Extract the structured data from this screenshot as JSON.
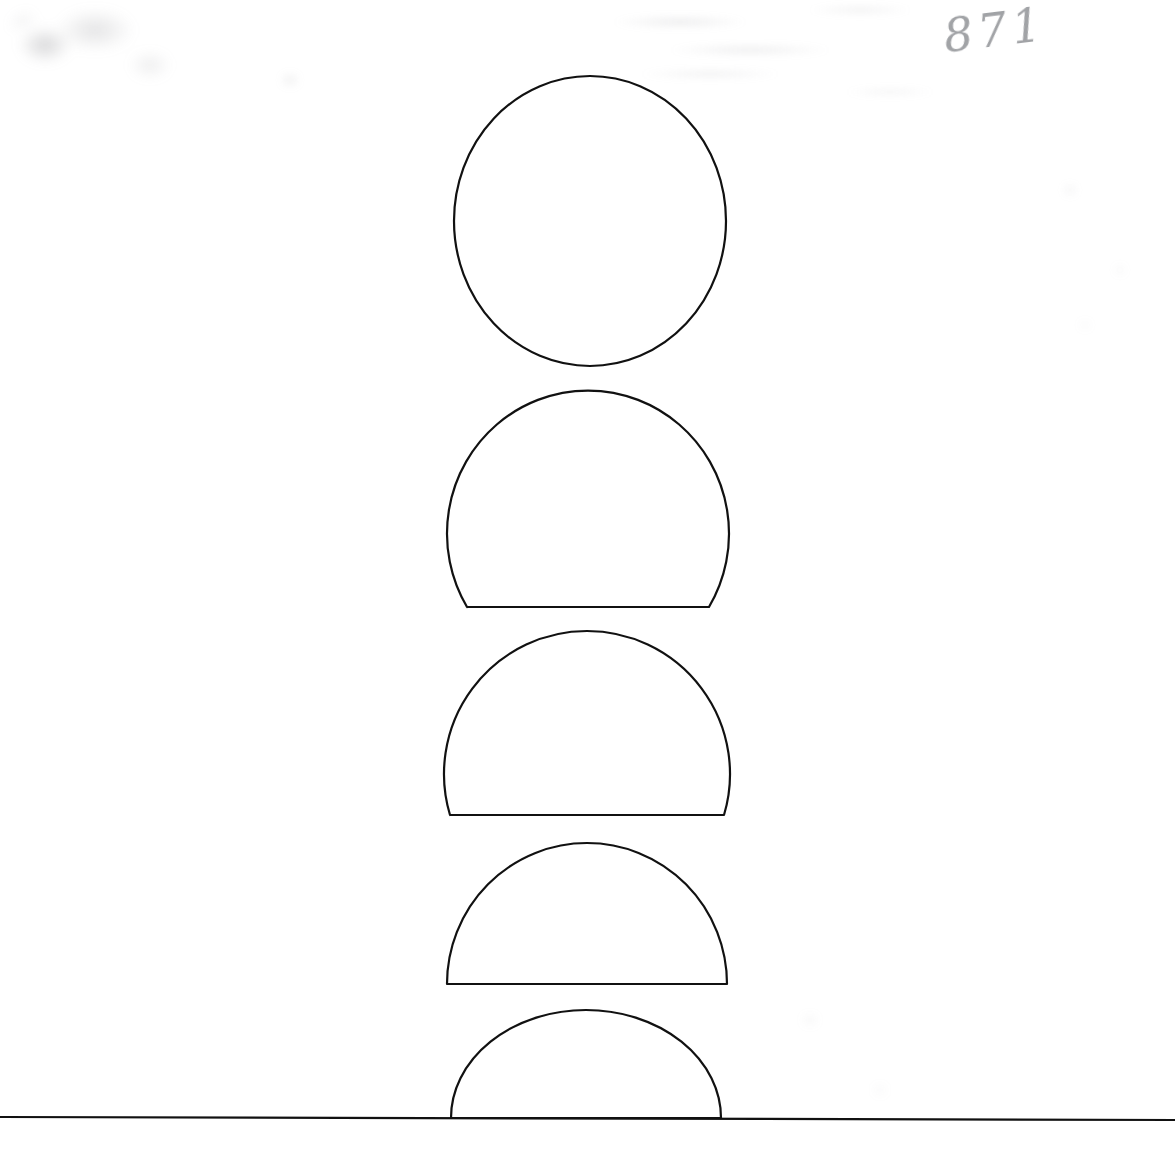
{
  "page": {
    "width": 1175,
    "height": 1159,
    "background_color": "#ffffff",
    "ink_color": "#111111",
    "medium": "scanned hand-drawn ink diagram on paper"
  },
  "annotations": {
    "catalog_number": "871",
    "catalog_number_color": "#8d8f93",
    "catalog_number_position": "top-right"
  },
  "artifacts": [
    {
      "name": "smudge-topleft",
      "label": "gray scan smudge"
    },
    {
      "name": "ghost-text-top",
      "label": "faint bleed-through text"
    },
    {
      "name": "speck-right",
      "label": "paper specks"
    },
    {
      "name": "speck-midleft",
      "label": "paper speck"
    },
    {
      "name": "speck-lower",
      "label": "paper specks"
    }
  ],
  "chart_data": {
    "type": "diagram",
    "title": "871",
    "subtitle": "Sequence of circular segments cut by a chord, descending to a ground line",
    "xlabel": "",
    "ylabel": "",
    "grid": false,
    "legend": false,
    "baseline": {
      "name": "ground-line",
      "x1": 0,
      "y1": 1117,
      "x2": 1175,
      "y2": 1120,
      "stroke_width": 2.2
    },
    "shapes": [
      {
        "index": 1,
        "name": "full-circle",
        "kind": "circle",
        "center_x": 590,
        "center_y": 221,
        "radius_x": 136,
        "radius_y": 145,
        "chord_y": null,
        "top_y": 76,
        "bottom_y": 365,
        "left_x": 454,
        "right_x": 726,
        "width": 272,
        "height": 289,
        "fraction_visible": 1.0
      },
      {
        "index": 2,
        "name": "segment-large",
        "kind": "circular-segment",
        "center_x": 589,
        "center_y": 534,
        "radius_x": 141,
        "radius_y": 143,
        "chord_y": 607,
        "top_y": 392,
        "bottom_y": 607,
        "left_x": 448,
        "right_x": 730,
        "chord_left_x": 467,
        "chord_right_x": 709,
        "width": 282,
        "height": 215,
        "fraction_visible": 0.75
      },
      {
        "index": 3,
        "name": "segment-medium",
        "kind": "circular-segment",
        "center_x": 587,
        "center_y": 775,
        "radius_x": 143,
        "radius_y": 143,
        "chord_y": 815,
        "top_y": 632,
        "bottom_y": 815,
        "left_x": 444,
        "right_x": 730,
        "chord_left_x": 450,
        "chord_right_x": 724,
        "width": 286,
        "height": 183,
        "fraction_visible": 0.64
      },
      {
        "index": 4,
        "name": "semicircle",
        "kind": "semicircle",
        "center_x": 587,
        "center_y": 984,
        "radius_x": 140,
        "radius_y": 141,
        "chord_y": 984,
        "top_y": 843,
        "bottom_y": 984,
        "left_x": 447,
        "right_x": 727,
        "chord_left_x": 447,
        "chord_right_x": 727,
        "width": 280,
        "height": 141,
        "fraction_visible": 0.5
      },
      {
        "index": 5,
        "name": "segment-shallow",
        "kind": "circular-segment",
        "center_x": 586,
        "center_y": 1119,
        "radius_x": 135,
        "radius_y": 108,
        "chord_y": 1118,
        "top_y": 1011,
        "bottom_y": 1118,
        "left_x": 451,
        "right_x": 721,
        "chord_left_x": 451,
        "chord_right_x": 721,
        "width": 270,
        "height": 107,
        "fraction_visible": 0.38
      }
    ]
  }
}
